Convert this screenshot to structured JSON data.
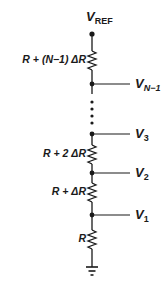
{
  "diagram": {
    "supply": {
      "label_main": "V",
      "label_sub": "REF"
    },
    "resistors": [
      {
        "label": "R + (N−1) ΔR",
        "y": 60
      },
      {
        "label": "R + 2 ΔR",
        "y": 154
      },
      {
        "label": "R + ΔR",
        "y": 192
      },
      {
        "label": "R",
        "y": 239
      }
    ],
    "taps": [
      {
        "label_main": "V",
        "label_sub": "N−1",
        "y": 84
      },
      {
        "label_main": "V",
        "label_sub": "3",
        "y": 134
      },
      {
        "label_main": "V",
        "label_sub": "2",
        "y": 173
      },
      {
        "label_main": "V",
        "label_sub": "1",
        "y": 215
      }
    ],
    "ellipsis_dots": 4,
    "ground": "ground-symbol",
    "colors": {
      "wire": "#1a1a1a",
      "background": "#ffffff"
    }
  }
}
